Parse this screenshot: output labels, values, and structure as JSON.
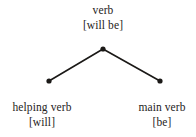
{
  "diagram": {
    "type": "syntax-tree",
    "background_color": "#ffffff",
    "line_color": "#1b1917",
    "text_color": "#262422",
    "nodes": [
      {
        "id": "root",
        "role": "parent",
        "category": "verb",
        "word": "[will be]",
        "x": 103,
        "y": 49
      },
      {
        "id": "left",
        "role": "child",
        "category": "helping verb",
        "word": "[will]",
        "x": 49,
        "y": 81
      },
      {
        "id": "right",
        "role": "child",
        "category": "main verb",
        "word": "[be]",
        "x": 160,
        "y": 81
      }
    ],
    "edges": [
      {
        "from": "root",
        "to": "left"
      },
      {
        "from": "root",
        "to": "right"
      }
    ]
  }
}
